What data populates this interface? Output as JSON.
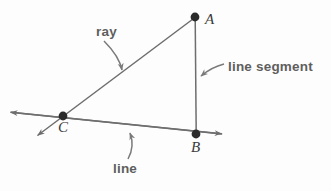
{
  "figure": {
    "background_color": "#fdfdfd",
    "stroke_color": "#6e6e6e",
    "point_color": "#2b2b2b",
    "callout_color": "#5f5f5f",
    "point_label_color": "#3a3a3a"
  },
  "callouts": {
    "ray_label": "ray",
    "line_segment_label": "line segment",
    "line_label": "line"
  },
  "points": {
    "a_label": "A",
    "b_label": "B",
    "c_label": "C",
    "a": {
      "x": 195,
      "y": 17
    },
    "b": {
      "x": 196,
      "y": 134
    },
    "c": {
      "x": 63,
      "y": 116
    }
  },
  "geometry": {
    "ray": {
      "name": "ray-from-A-through-C",
      "from": {
        "x": 195,
        "y": 17
      },
      "through": {
        "x": 63,
        "y": 116
      },
      "arrow_tip": {
        "x": 36,
        "y": 137
      },
      "has_arrow_at_end": true
    },
    "line_segment": {
      "name": "segment-AB",
      "from": {
        "x": 195,
        "y": 17
      },
      "to": {
        "x": 196,
        "y": 134
      },
      "has_arrow": false
    },
    "line": {
      "name": "line-through-C-and-B",
      "arrow_tip_left": {
        "x": 9,
        "y": 112
      },
      "arrow_tip_right": {
        "x": 223,
        "y": 134
      },
      "has_arrow_both_ends": true
    }
  },
  "annotation_arrows": {
    "ray_arrow": {
      "from": {
        "x": 110,
        "y": 40
      },
      "to": {
        "x": 123,
        "y": 73
      }
    },
    "line_segment_arrow": {
      "from": {
        "x": 222,
        "y": 63
      },
      "to": {
        "x": 197,
        "y": 78
      }
    },
    "line_arrow": {
      "from": {
        "x": 129,
        "y": 160
      },
      "to": {
        "x": 130,
        "y": 130
      }
    }
  }
}
